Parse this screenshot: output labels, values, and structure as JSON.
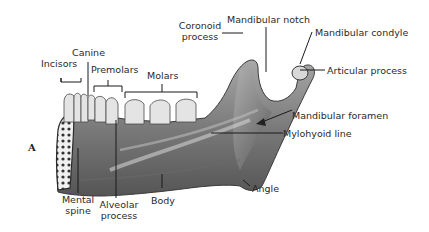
{
  "figure": {
    "letter": "A"
  },
  "labels": {
    "incisors": "Incisors",
    "canine": "Canine",
    "premolars": "Premolars",
    "molars": "Molars",
    "coronoid_process_1": "Coronoid",
    "coronoid_process_2": "process",
    "mandibular_notch": "Mandibular notch",
    "mandibular_condyle": "Mandibular condyle",
    "articular_process": "Articular process",
    "mandibular_foramen": "Mandibular foramen",
    "mylohyoid_line": "Mylohyoid line",
    "angle": "Angle",
    "mental_spine_1": "Mental",
    "mental_spine_2": "spine",
    "alveolar_process_1": "Alveolar",
    "alveolar_process_2": "process",
    "body": "Body"
  },
  "colors": {
    "bone_dark": "#5a5a5a",
    "bone_mid": "#8a8a8a",
    "bone_light": "#c8c8c8",
    "tooth": "#e6e6e6",
    "leader": "#1a1a1a"
  }
}
